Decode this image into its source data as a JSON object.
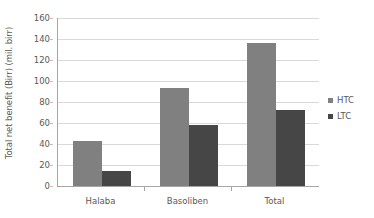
{
  "chart_data": {
    "type": "bar",
    "title": "",
    "subtitle": "",
    "xlabel": "",
    "ylabel": "Total net benefit (Birr) (mil. birr)",
    "categories": [
      "Halaba",
      "Basoliben",
      "Total"
    ],
    "series": [
      {
        "name": "HTC",
        "color": "#808080",
        "values": [
          43,
          93,
          136
        ]
      },
      {
        "name": "LTC",
        "color": "#464646",
        "values": [
          14,
          58,
          72
        ]
      }
    ],
    "ylim": [
      0,
      160
    ],
    "ytick_step": 20,
    "yticks": [
      0,
      20,
      40,
      60,
      80,
      100,
      120,
      140,
      160
    ],
    "ytick_labels": [
      "0",
      "20",
      "40",
      "60",
      "80",
      "100",
      "120",
      "140",
      "160"
    ],
    "grid": {
      "horizontal": true,
      "vertical": false,
      "color": "#d9d9d9"
    },
    "legend": {
      "position": "right",
      "entries": [
        "HTC",
        "LTC"
      ]
    },
    "plot_background": "#ffffff",
    "axis_color": "#a6a6a6",
    "text_color": "#595959"
  }
}
